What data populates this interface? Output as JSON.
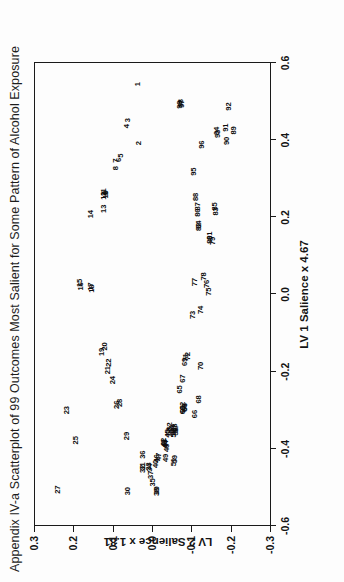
{
  "figure": {
    "title": "Appendix IV-a  Scatterplot of 99 Outcomes Most Salient for Some Pattern of Alcohol Exposure"
  },
  "chart_data": {
    "type": "scatter",
    "title": "Appendix IV-a  Scatterplot of 99 Outcomes Most Salient for Some Pattern of Alcohol Exposure",
    "xlabel": "LV 1 Salience x 4.67",
    "ylabel": "LV 2 Salience x 1.81",
    "xlim": [
      -0.6,
      0.6
    ],
    "ylim": [
      -0.3,
      0.3
    ],
    "xticks": [
      "-0.6",
      "-0.4",
      "-0.2",
      "0.0",
      "0.2",
      "0.4",
      "0.6"
    ],
    "xtick_values": [
      -0.6,
      -0.4,
      -0.2,
      0.0,
      0.2,
      0.4,
      0.6
    ],
    "yticks": [
      "-0.3",
      "-0.2",
      "-0.1",
      "0.0",
      "0.1",
      "0.2",
      "0.3"
    ],
    "ytick_values": [
      -0.3,
      -0.2,
      -0.1,
      0.0,
      0.1,
      0.2,
      0.3
    ],
    "grid": false,
    "legend": false,
    "marker": "numeric-label",
    "n_points": 99,
    "point_label_field": "label",
    "points": [
      {
        "label": "1",
        "x": 0.545,
        "y": 0.035
      },
      {
        "label": "2",
        "x": 0.392,
        "y": 0.032
      },
      {
        "label": "3",
        "x": 0.452,
        "y": 0.062
      },
      {
        "label": "4",
        "x": 0.436,
        "y": 0.064
      },
      {
        "label": "5",
        "x": 0.36,
        "y": 0.08
      },
      {
        "label": "6",
        "x": 0.349,
        "y": 0.083
      },
      {
        "label": "7",
        "x": 0.347,
        "y": 0.092
      },
      {
        "label": "8",
        "x": 0.327,
        "y": 0.092
      },
      {
        "label": "9",
        "x": 0.262,
        "y": 0.116
      },
      {
        "label": "10",
        "x": 0.259,
        "y": 0.118
      },
      {
        "label": "11",
        "x": 0.265,
        "y": 0.122
      },
      {
        "label": "12",
        "x": 0.256,
        "y": 0.122
      },
      {
        "label": "13",
        "x": 0.222,
        "y": 0.122
      },
      {
        "label": "14",
        "x": 0.208,
        "y": 0.155
      },
      {
        "label": "15",
        "x": 0.03,
        "y": 0.182
      },
      {
        "label": "16",
        "x": 0.021,
        "y": 0.181
      },
      {
        "label": "17",
        "x": 0.02,
        "y": 0.155
      },
      {
        "label": "18",
        "x": 0.015,
        "y": 0.152
      },
      {
        "label": "19",
        "x": -0.149,
        "y": 0.128
      },
      {
        "label": "20",
        "x": -0.135,
        "y": 0.12
      },
      {
        "label": "21",
        "x": -0.196,
        "y": 0.112
      },
      {
        "label": "22",
        "x": -0.177,
        "y": 0.11
      },
      {
        "label": "23",
        "x": -0.3,
        "y": 0.215
      },
      {
        "label": "24",
        "x": -0.222,
        "y": 0.1
      },
      {
        "label": "25",
        "x": -0.378,
        "y": 0.192
      },
      {
        "label": "26",
        "x": -0.286,
        "y": 0.09
      },
      {
        "label": "27",
        "x": -0.506,
        "y": 0.238
      },
      {
        "label": "28",
        "x": -0.281,
        "y": 0.082
      },
      {
        "label": "29",
        "x": -0.367,
        "y": 0.064
      },
      {
        "label": "30",
        "x": -0.51,
        "y": 0.06
      },
      {
        "label": "31",
        "x": -0.446,
        "y": 0.024
      },
      {
        "label": "32",
        "x": -0.452,
        "y": 0.022
      },
      {
        "label": "33",
        "x": -0.446,
        "y": 0.007
      },
      {
        "label": "34",
        "x": -0.449,
        "y": 0.004
      },
      {
        "label": "35",
        "x": -0.487,
        "y": -0.003
      },
      {
        "label": "36",
        "x": -0.415,
        "y": 0.023
      },
      {
        "label": "37",
        "x": -0.468,
        "y": 0.002
      },
      {
        "label": "38",
        "x": -0.512,
        "y": -0.013
      },
      {
        "label": "39",
        "x": -0.508,
        "y": -0.012
      },
      {
        "label": "40",
        "x": -0.439,
        "y": -0.009
      },
      {
        "label": "41",
        "x": -0.385,
        "y": -0.031
      },
      {
        "label": "42",
        "x": -0.382,
        "y": -0.031
      },
      {
        "label": "43",
        "x": -0.386,
        "y": -0.034
      },
      {
        "label": "44",
        "x": -0.389,
        "y": -0.036
      },
      {
        "label": "45",
        "x": -0.36,
        "y": -0.04
      },
      {
        "label": "46",
        "x": -0.425,
        "y": -0.013
      },
      {
        "label": "47",
        "x": -0.421,
        "y": -0.017
      },
      {
        "label": "48",
        "x": -0.398,
        "y": -0.037
      },
      {
        "label": "49",
        "x": -0.424,
        "y": -0.035
      },
      {
        "label": "50",
        "x": -0.356,
        "y": -0.044
      },
      {
        "label": "51",
        "x": -0.435,
        "y": -0.057
      },
      {
        "label": "52",
        "x": -0.342,
        "y": -0.045
      },
      {
        "label": "53",
        "x": -0.356,
        "y": -0.057
      },
      {
        "label": "54",
        "x": -0.349,
        "y": -0.051
      },
      {
        "label": "55",
        "x": -0.36,
        "y": -0.057
      },
      {
        "label": "56",
        "x": -0.355,
        "y": -0.06
      },
      {
        "label": "57",
        "x": -0.348,
        "y": -0.06
      },
      {
        "label": "58",
        "x": -0.345,
        "y": -0.058
      },
      {
        "label": "59",
        "x": -0.427,
        "y": -0.058
      },
      {
        "label": "60",
        "x": -0.3,
        "y": -0.078
      },
      {
        "label": "61",
        "x": -0.297,
        "y": -0.08
      },
      {
        "label": "62",
        "x": -0.289,
        "y": -0.08
      },
      {
        "label": "63",
        "x": -0.292,
        "y": -0.083
      },
      {
        "label": "64",
        "x": -0.294,
        "y": -0.085
      },
      {
        "label": "65",
        "x": -0.246,
        "y": -0.071
      },
      {
        "label": "66",
        "x": -0.31,
        "y": -0.11
      },
      {
        "label": "67",
        "x": -0.218,
        "y": -0.078
      },
      {
        "label": "68",
        "x": -0.272,
        "y": -0.12
      },
      {
        "label": "69",
        "x": -0.175,
        "y": -0.085
      },
      {
        "label": "70",
        "x": -0.185,
        "y": -0.125
      },
      {
        "label": "71",
        "x": -0.163,
        "y": -0.086
      },
      {
        "label": "72",
        "x": -0.16,
        "y": -0.092
      },
      {
        "label": "73",
        "x": -0.053,
        "y": -0.105
      },
      {
        "label": "74",
        "x": -0.04,
        "y": -0.125
      },
      {
        "label": "75",
        "x": 0.007,
        "y": -0.145
      },
      {
        "label": "76",
        "x": 0.027,
        "y": -0.14
      },
      {
        "label": "77",
        "x": 0.032,
        "y": -0.11
      },
      {
        "label": "78",
        "x": 0.047,
        "y": -0.132
      },
      {
        "label": "79",
        "x": 0.139,
        "y": -0.155
      },
      {
        "label": "80",
        "x": 0.142,
        "y": -0.148
      },
      {
        "label": "81",
        "x": 0.152,
        "y": -0.148
      },
      {
        "label": "82",
        "x": 0.175,
        "y": -0.12
      },
      {
        "label": "83",
        "x": 0.215,
        "y": -0.162
      },
      {
        "label": "84",
        "x": 0.181,
        "y": -0.12
      },
      {
        "label": "85",
        "x": 0.228,
        "y": -0.16
      },
      {
        "label": "86",
        "x": 0.212,
        "y": -0.118
      },
      {
        "label": "87",
        "x": 0.228,
        "y": -0.116
      },
      {
        "label": "88",
        "x": 0.253,
        "y": -0.113
      },
      {
        "label": "89",
        "x": 0.425,
        "y": -0.209
      },
      {
        "label": "90",
        "x": 0.398,
        "y": -0.19
      },
      {
        "label": "91",
        "x": 0.432,
        "y": -0.188
      },
      {
        "label": "92",
        "x": 0.487,
        "y": -0.197
      },
      {
        "label": "93",
        "x": 0.416,
        "y": -0.167
      },
      {
        "label": "94",
        "x": 0.424,
        "y": -0.164
      },
      {
        "label": "95",
        "x": 0.318,
        "y": -0.106
      },
      {
        "label": "96",
        "x": 0.388,
        "y": -0.128
      },
      {
        "label": "97",
        "x": 0.494,
        "y": -0.075
      },
      {
        "label": "98",
        "x": 0.496,
        "y": -0.073
      },
      {
        "label": "99",
        "x": 0.492,
        "y": -0.07
      }
    ]
  }
}
